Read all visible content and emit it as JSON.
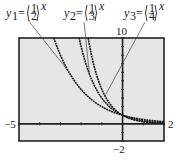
{
  "chart_data": {
    "type": "line",
    "title": "",
    "xlabel": "",
    "ylabel": "",
    "xlim": [
      -5,
      2
    ],
    "ylim": [
      -2,
      10
    ],
    "grid": false,
    "tick_labels": {
      "xmin": "−5",
      "xmax": "2",
      "ymin": "−2",
      "ymax": "10"
    },
    "series": [
      {
        "name": "y1",
        "label_base": "y",
        "label_sub": "1",
        "num": "1",
        "den": "2",
        "exp": "x",
        "base": 0.5
      },
      {
        "name": "y2",
        "label_base": "y",
        "label_sub": "2",
        "num": "1",
        "den": "3",
        "exp": "x",
        "base": 0.3333333
      },
      {
        "name": "y3",
        "label_base": "y",
        "label_sub": "3",
        "num": "1",
        "den": "4",
        "exp": "x",
        "base": 0.25
      }
    ],
    "colors": {
      "curve": "#1a1a1a",
      "screen": "#e6e6e6",
      "frame": "#222222"
    }
  }
}
